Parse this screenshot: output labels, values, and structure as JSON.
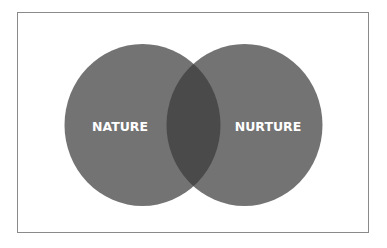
{
  "diagram": {
    "type": "venn",
    "sets": [
      {
        "id": "nature",
        "label": "NATURE"
      },
      {
        "id": "nurture",
        "label": "NURTURE"
      }
    ],
    "intersection": {
      "sets": [
        "nature",
        "nurture"
      ],
      "label": ""
    },
    "colors": {
      "circle_fill": "#737373",
      "intersection_fill": "#4a4a4a",
      "label_text": "#ffffff",
      "frame_border": "#8a8a8a",
      "background": "#ffffff"
    }
  }
}
